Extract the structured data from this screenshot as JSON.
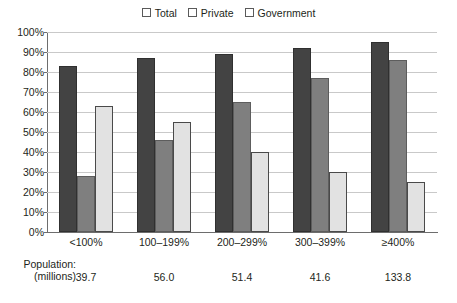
{
  "chart_data": {
    "type": "bar",
    "title": "",
    "subtitle": "",
    "xlabel": "",
    "ylabel": "",
    "ylim": [
      0,
      100
    ],
    "ytick_labels": [
      "100%",
      "90%",
      "80%",
      "70%",
      "60%",
      "50%",
      "40%",
      "30%",
      "20%",
      "10%",
      "0%"
    ],
    "ytick_values": [
      100,
      90,
      80,
      70,
      60,
      50,
      40,
      30,
      20,
      10,
      0
    ],
    "grid": true,
    "legend_position": "top-center",
    "categories": [
      "<100%",
      "100–199%",
      "200–299%",
      "300–399%",
      "≥400%"
    ],
    "series": [
      {
        "name": "Total",
        "color": "#434343",
        "values": [
          83,
          87,
          89,
          92,
          95
        ]
      },
      {
        "name": "Private",
        "color": "#7f7f7f",
        "values": [
          28,
          46,
          65,
          77,
          86
        ]
      },
      {
        "name": "Government",
        "color": "#e2e2e2",
        "values": [
          63,
          55,
          40,
          30,
          25
        ]
      }
    ],
    "annotations": {
      "population_caption_line1": "Population:",
      "population_caption_line2": "(millions)",
      "population_values": [
        "39.7",
        "56.0",
        "51.4",
        "41.6",
        "133.8"
      ]
    }
  }
}
